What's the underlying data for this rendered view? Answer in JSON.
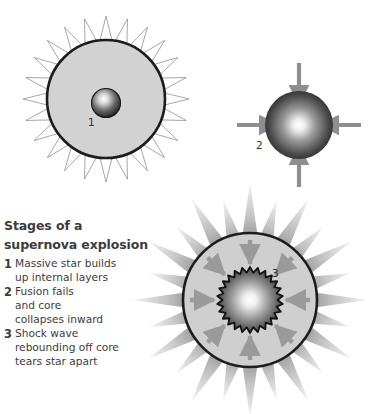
{
  "diagram": {
    "title_lines": [
      "Stages of a",
      "supernova explosion"
    ],
    "background_color": "#ffffff",
    "text_color": "#3c3c3c",
    "stages": [
      {
        "number": "1",
        "name": "main-sequence-star",
        "label": "1",
        "lines": [
          "Massive star builds",
          "up internal layers"
        ],
        "shell_fill": "#d2d2d2",
        "shell_stroke": "#1c1c1c",
        "spike_count": 24,
        "spike_fill": "#ffffff",
        "spike_stroke": "#8a8a8a",
        "core_center_color": "#ffffff",
        "core_edge_color": "#1a1a1a"
      },
      {
        "number": "2",
        "name": "collapsing-core",
        "label": "2",
        "lines": [
          "Fusion fails",
          "and core",
          "collapses inward"
        ],
        "sphere_center_color": "#ffffff",
        "sphere_edge_color": "#141414",
        "arrow_count": 4,
        "arrow_color": "#8e8e8e",
        "arrow_direction": "inward"
      },
      {
        "number": "3",
        "name": "shock-wave-explosion",
        "label": "3",
        "lines": [
          "Shock wave",
          "rebounding off core",
          "tears star apart"
        ],
        "shell_fill": "#cfcfcf",
        "shell_stroke": "#1c1c1c",
        "ray_count": 24,
        "ray_base_color": "#7d7d7d",
        "ray_tip_color": "#f2f2f2",
        "arrow_count": 8,
        "arrow_color": "#9a9a9a",
        "arrow_direction": "inward",
        "core_shape": "jagged-star",
        "core_teeth": 26,
        "core_center_color": "#ffffff",
        "core_edge_color": "#2b2b2b",
        "core_stroke": "#111111"
      }
    ]
  }
}
